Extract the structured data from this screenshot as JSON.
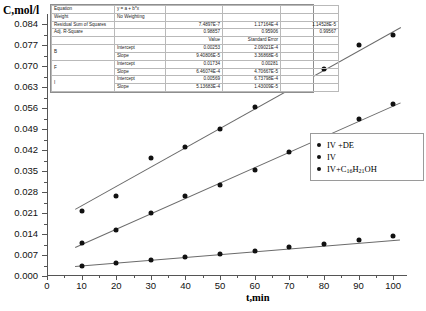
{
  "axes": {
    "ylabel": "C,mol/l",
    "xlabel": "t,min",
    "ytick_labels": [
      "0.000",
      "0.007",
      "0.014",
      "0.021",
      "0.028",
      "0.035",
      "0.042",
      "0.049",
      "0.056",
      "0.063",
      "0.070",
      "0.077",
      "0.084"
    ],
    "xtick_labels": [
      "0",
      "10",
      "20",
      "30",
      "40",
      "50",
      "60",
      "70",
      "80",
      "90",
      "100"
    ]
  },
  "stats_table": {
    "rows": [
      {
        "c0": "Equation",
        "c1": "y = a + b*x",
        "c2": "",
        "c3": "",
        "c4": ""
      },
      {
        "c0": "Weight",
        "c1": "No Weighting",
        "c2": "",
        "c3": "",
        "c4": ""
      },
      {
        "c0": "Residual Sum of Squares",
        "c1": "",
        "c2": "7.4897E-7",
        "c3": "1.17164E-4",
        "c4": "1.14528E-5"
      },
      {
        "c0": "Adj. R-Square",
        "c1": "",
        "c2": "0.98857",
        "c3": "0.95906",
        "c4": "0.99567"
      },
      {
        "c0": "",
        "c1": "",
        "c2": "Value",
        "c3": "Standard Error",
        "c4": ""
      },
      {
        "c0": "B",
        "c1": "Intercept",
        "c2": "0.00253",
        "c3": "2.09021E-4",
        "c4": ""
      },
      {
        "c0": "B",
        "c1": "Slope",
        "c2": "9.40806E-5",
        "c3": "3.36868E-6",
        "c4": ""
      },
      {
        "c0": "F",
        "c1": "Intercept",
        "c2": "0.01734",
        "c3": "0.00281",
        "c4": ""
      },
      {
        "c0": "F",
        "c1": "Slope",
        "c2": "6.46074E-4",
        "c3": "4.70667E-5",
        "c4": ""
      },
      {
        "c0": "I",
        "c1": "Intercept",
        "c2": "0.00569",
        "c3": "6.73798E-4",
        "c4": ""
      },
      {
        "c0": "I",
        "c1": "Slope",
        "c2": "5.13683E-4",
        "c3": "1.43009E-5",
        "c4": ""
      }
    ]
  },
  "legend": {
    "items": [
      {
        "label": "IV +DE",
        "html": "IV +DE"
      },
      {
        "label": "IV",
        "html": "IV"
      },
      {
        "label": "IV+C16H21OH",
        "html": "IV+C<sub>16</sub>H<sub>21</sub>OH"
      }
    ]
  },
  "chart_data": {
    "type": "scatter",
    "title": "",
    "xlabel": "t,min",
    "ylabel": "C,mol/l",
    "xlim": [
      0,
      104
    ],
    "ylim": [
      0,
      0.0875
    ],
    "xticks": [
      0,
      10,
      20,
      30,
      40,
      50,
      60,
      70,
      80,
      90,
      100
    ],
    "yticks": [
      0,
      0.007,
      0.014,
      0.021,
      0.028,
      0.035,
      0.042,
      0.049,
      0.056,
      0.063,
      0.07,
      0.077,
      0.084
    ],
    "grid": false,
    "legend_position": "right-middle",
    "series": [
      {
        "name": "IV +DE",
        "fit_key": "B",
        "marker": "filled-circle",
        "color": "#111111",
        "intercept": 0.00253,
        "slope": 9.40806e-05,
        "x": [
          10,
          20,
          30,
          40,
          50,
          60,
          70,
          80,
          90,
          100
        ],
        "y": [
          0.0032,
          0.0043,
          0.0053,
          0.0063,
          0.0073,
          0.0085,
          0.0098,
          0.0107,
          0.012,
          0.0132
        ]
      },
      {
        "name": "IV",
        "fit_key": "I",
        "marker": "filled-circle",
        "color": "#111111",
        "intercept": 0.00569,
        "slope": 0.000513683,
        "x": [
          10,
          20,
          30,
          40,
          50,
          60,
          70,
          80,
          90,
          100
        ],
        "y": [
          0.011,
          0.0155,
          0.021,
          0.0267,
          0.0305,
          0.0355,
          0.0415,
          0.0465,
          0.0525,
          0.0575
        ]
      },
      {
        "name": "IV+C16H21OH",
        "fit_key": "F",
        "marker": "filled-circle",
        "color": "#111111",
        "intercept": 0.01734,
        "slope": 0.000646074,
        "x": [
          10,
          20,
          30,
          40,
          50,
          60,
          70,
          80,
          90,
          100
        ],
        "y": [
          0.0218,
          0.0268,
          0.0395,
          0.043,
          0.049,
          0.0565,
          0.062,
          0.069,
          0.077,
          0.0805
        ]
      }
    ],
    "fit_lines": [
      {
        "name": "IV +DE fit",
        "intercept": 0.00253,
        "slope": 9.40806e-05,
        "x_range": [
          8,
          102
        ]
      },
      {
        "name": "IV fit",
        "intercept": 0.00569,
        "slope": 0.000513683,
        "x_range": [
          8,
          102
        ]
      },
      {
        "name": "IV+C16H21OH fit",
        "intercept": 0.01734,
        "slope": 0.000646074,
        "x_range": [
          8,
          102
        ]
      }
    ]
  }
}
